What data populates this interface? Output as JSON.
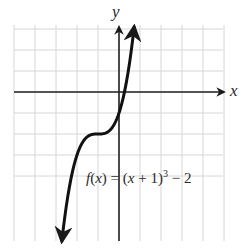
{
  "chart_data": {
    "type": "line",
    "title": "",
    "xlabel": "x",
    "ylabel": "y",
    "xlim": [
      -5,
      5
    ],
    "ylim": [
      -7,
      3
    ],
    "grid": true,
    "grid_step": 1,
    "legend": null,
    "annotations": [
      {
        "text": "f(x) = (x + 1)^3 − 2",
        "position": "lower-right"
      }
    ],
    "series": [
      {
        "name": "f(x) = (x + 1)^3 − 2",
        "function": "(x+1)^3 - 2",
        "x": [
          -2.72,
          -2.5,
          -2.25,
          -2,
          -1.75,
          -1.5,
          -1.25,
          -1,
          -0.75,
          -0.5,
          -0.25,
          0,
          0.25,
          0.5,
          0.72
        ],
        "values": [
          -7.05,
          -5.38,
          -3.95,
          -3.0,
          -2.42,
          -2.13,
          -2.02,
          -2.0,
          -1.98,
          -1.88,
          -1.58,
          -1.0,
          -0.05,
          1.38,
          3.09
        ],
        "arrows": "both-ends"
      }
    ]
  },
  "labels": {
    "x_axis": "x",
    "y_axis": "y",
    "equation_f": "f",
    "equation_open": "(",
    "equation_x": "x",
    "equation_close": ")",
    "equation_eq": " = (",
    "equation_x2": "x",
    "equation_plus": " + 1)",
    "equation_exp": "3",
    "equation_tail": " − 2"
  },
  "colors": {
    "grid": "#d6d6d6",
    "axis": "#222222",
    "curve": "#111111"
  }
}
